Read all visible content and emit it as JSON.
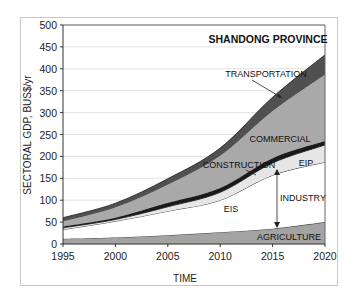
{
  "chart_data": {
    "type": "area",
    "stacked": true,
    "title": "SHANDONG PROVINCE",
    "xlabel": "TIME",
    "ylabel": "SECTORAL GDP, BUS$/yr",
    "x": [
      1995,
      2000,
      2005,
      2010,
      2015,
      2020
    ],
    "xticks": [
      "1995",
      "2000",
      "2005",
      "2010",
      "2015",
      "2020"
    ],
    "yticks": [
      "0",
      "50",
      "100",
      "150",
      "200",
      "250",
      "300",
      "350",
      "400",
      "450",
      "500"
    ],
    "ylim": [
      0,
      500
    ],
    "grid": true,
    "cumulative_boundaries": [
      {
        "name": "AGRICULTURE",
        "values": [
          12,
          15,
          20,
          27,
          35,
          50
        ],
        "color": "#a3a3a3"
      },
      {
        "name": "EIS",
        "values": [
          33,
          52,
          75,
          100,
          157,
          187
        ],
        "color": "#ffffff"
      },
      {
        "name": "EIP",
        "values": [
          37,
          56,
          85,
          118,
          185,
          226
        ],
        "color": "#e6e6e6"
      },
      {
        "name": "CONSTRUCTION",
        "values": [
          40,
          60,
          94,
          128,
          196,
          235
        ],
        "color": "#1a1a1a"
      },
      {
        "name": "COMMERCIAL",
        "values": [
          53,
          85,
          137,
          203,
          305,
          388
        ],
        "color": "#a9a9a9"
      },
      {
        "name": "TRANSPORTATION",
        "values": [
          60,
          93,
          149,
          219,
          335,
          432
        ],
        "color": "#505050"
      }
    ],
    "annotations": [
      {
        "text": "TRANSPORTATION",
        "arrow_to_year": 2017
      },
      {
        "text": "COMMERCIAL"
      },
      {
        "text": "CONSTRUCTION",
        "arrow_to_year": 2013
      },
      {
        "text": "EIP"
      },
      {
        "text": "INDUSTRY",
        "double_arrow_year": 2015
      },
      {
        "text": "EIS"
      },
      {
        "text": "AGRICULTURE"
      }
    ]
  },
  "labels": {
    "title": "SHANDONG PROVINCE",
    "xlabel": "TIME",
    "ylabel": "SECTORAL GDP, BUS$/yr",
    "transportation": "TRANSPORTATION",
    "commercial": "COMMERCIAL",
    "construction": "CONSTRUCTION",
    "eip": "EIP",
    "industry": "INDUSTRY",
    "eis": "EIS",
    "agriculture": "AGRICULTURE"
  }
}
